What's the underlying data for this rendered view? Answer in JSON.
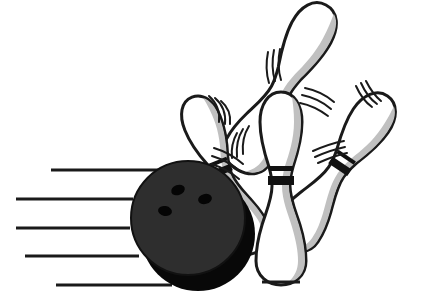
{
  "artwork": {
    "title": "Bowling Ball Striking Pins",
    "subject": "bowling-strike",
    "style": "black-and-white-clip-art",
    "width": 423,
    "height": 299,
    "background_color": "#ffffff",
    "palette": {
      "outline": "#1a1a1a",
      "ink_black": "#111111",
      "pin_white": "#ffffff",
      "pin_shade_gray": "#c0c0c0",
      "pin_shade_gray_dark": "#a9a9a9",
      "ball_body": "#2e2e2e",
      "ball_shadow": "#080808",
      "ball_hole": "#050505",
      "speed_line": "#1a1a1a"
    },
    "elements": {
      "ball_label": "bowling ball",
      "pins_label": "bowling pins",
      "speed_lines_label": "motion speed lines",
      "motion_arcs_label": "impact motion arcs"
    }
  },
  "ball": {
    "name": "bowling ball",
    "center_x": 188,
    "center_y": 218,
    "radius": 57,
    "shadow_offset_x": 10,
    "shadow_offset_y": 16,
    "finger_holes": [
      {
        "cx": 178,
        "cy": 190,
        "rx": 7,
        "ry": 5,
        "rotate": -20
      },
      {
        "cx": 205,
        "cy": 199,
        "rx": 7,
        "ry": 5,
        "rotate": -15
      },
      {
        "cx": 165,
        "cy": 211,
        "rx": 7,
        "ry": 5,
        "rotate": 10
      }
    ]
  },
  "speed_lines": [
    {
      "id": "speed-line-1",
      "x1": 51,
      "y1": 170,
      "x2": 170,
      "y2": 170,
      "width": 3
    },
    {
      "id": "speed-line-2",
      "x1": 16,
      "y1": 199,
      "x2": 133,
      "y2": 199,
      "width": 3
    },
    {
      "id": "speed-line-3",
      "x1": 16,
      "y1": 228,
      "x2": 130,
      "y2": 228,
      "width": 3
    },
    {
      "id": "speed-line-4",
      "x1": 25,
      "y1": 256,
      "x2": 139,
      "y2": 256,
      "width": 3
    },
    {
      "id": "speed-line-5",
      "x1": 56,
      "y1": 285,
      "x2": 172,
      "y2": 285,
      "width": 3
    }
  ],
  "pins": [
    {
      "id": "pin-flying-top",
      "label": "flying pin top right",
      "tilt_degrees": 28,
      "head_x": 318,
      "head_y": 20,
      "has_band": false,
      "z_order": 1
    },
    {
      "id": "pin-left-back",
      "label": "tilted pin back left",
      "tilt_degrees": -22,
      "head_x": 198,
      "head_y": 112,
      "has_band": true,
      "z_order": 2
    },
    {
      "id": "pin-right",
      "label": "tilted pin right",
      "tilt_degrees": 34,
      "head_x": 378,
      "head_y": 110,
      "has_band": true,
      "z_order": 3
    },
    {
      "id": "pin-center-front",
      "label": "upright pin center front",
      "tilt_degrees": 0,
      "head_x": 281,
      "head_y": 110,
      "has_band": true,
      "z_order": 4
    }
  ],
  "motion_arcs": [
    {
      "id": "motion-arc-left-pin-head",
      "near": "pin-left-back",
      "count": 3
    },
    {
      "id": "motion-arc-left-pin-body",
      "near": "pin-left-back",
      "count": 3
    },
    {
      "id": "motion-arc-center-pin-neck",
      "near": "pin-center-front",
      "count": 3
    },
    {
      "id": "motion-arc-flying-pin-left",
      "near": "pin-flying-top",
      "count": 3
    },
    {
      "id": "motion-arc-flying-pin-right",
      "near": "pin-flying-top",
      "count": 3
    },
    {
      "id": "motion-arc-right-pin-head",
      "near": "pin-right",
      "count": 3
    },
    {
      "id": "motion-arc-right-pin-body",
      "near": "pin-right",
      "count": 3
    }
  ]
}
